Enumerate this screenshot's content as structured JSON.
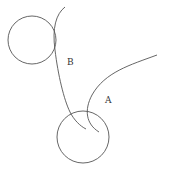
{
  "diagram": {
    "width": 173,
    "height": 178,
    "stroke_color": "#555555",
    "circles": [
      {
        "id": "B",
        "cx": 32,
        "cy": 40,
        "r": 24
      },
      {
        "id": "A",
        "cx": 83,
        "cy": 137,
        "r": 26
      }
    ],
    "curves": [
      {
        "id": "curve-b",
        "d": "M 65 7 C 56 14, 52 28, 55 50 C 58 75, 64 100, 70 112 C 74 120, 80 126, 86 129"
      },
      {
        "id": "curve-a",
        "d": "M 157 55 C 130 65, 105 72, 92 95 C 84 110, 86 124, 99 132"
      }
    ],
    "labels": [
      {
        "id": "B",
        "text": "B",
        "x": 67,
        "y": 65
      },
      {
        "id": "A",
        "text": "A",
        "x": 105,
        "y": 103
      }
    ]
  }
}
